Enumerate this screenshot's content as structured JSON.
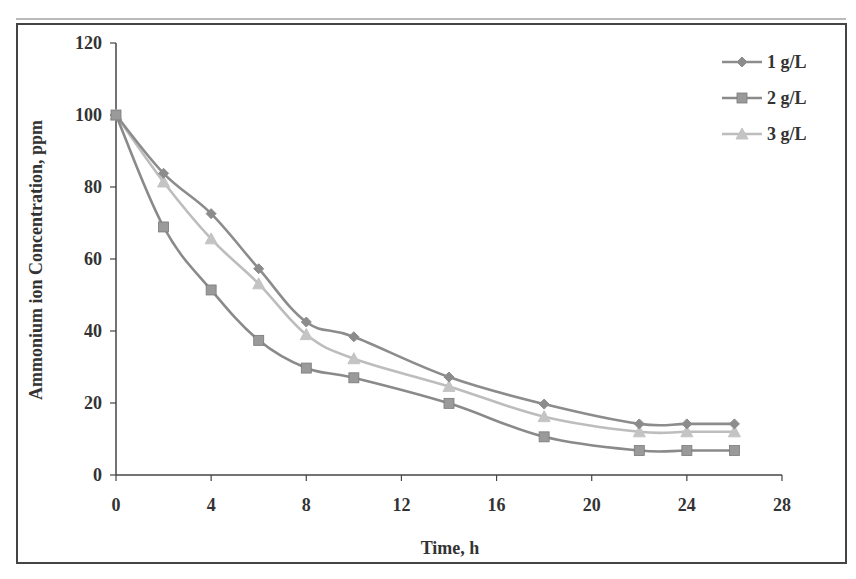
{
  "chart_data": {
    "type": "line",
    "title": "",
    "xlabel": "Time, h",
    "ylabel": "Ammonium ion Concentration, ppm",
    "xlim": [
      0,
      28
    ],
    "ylim": [
      0,
      120
    ],
    "xticks": [
      0,
      4,
      8,
      12,
      16,
      20,
      24,
      28
    ],
    "yticks": [
      0,
      20,
      40,
      60,
      80,
      100,
      120
    ],
    "grid": false,
    "legend_position": "upper right",
    "x": [
      0,
      2,
      4,
      6,
      8,
      10,
      14,
      18,
      22,
      24,
      26
    ],
    "series": [
      {
        "name": "1 g/L",
        "marker": "diamond",
        "color": "#8c8c8c",
        "values": [
          100,
          83.8,
          72.6,
          57.3,
          42.5,
          38.4,
          27.2,
          19.7,
          14.2,
          14.2,
          14.2
        ]
      },
      {
        "name": "2 g/L",
        "marker": "square",
        "color": "#8a8a8a",
        "values": [
          100,
          68.9,
          51.4,
          37.4,
          29.7,
          27.0,
          19.9,
          10.6,
          6.8,
          6.8,
          6.8
        ]
      },
      {
        "name": "3 g/L",
        "marker": "triangle",
        "color": "#bdbdbd",
        "values": [
          100,
          81.4,
          65.6,
          53.1,
          39.0,
          32.3,
          24.6,
          16.2,
          12.0,
          12.0,
          12.0
        ]
      }
    ]
  },
  "labels": {
    "xlabel": "Time, h",
    "ylabel": "Ammonium ion Concentration, ppm",
    "legend": [
      "1 g/L",
      "2 g/L",
      "3 g/L"
    ]
  }
}
